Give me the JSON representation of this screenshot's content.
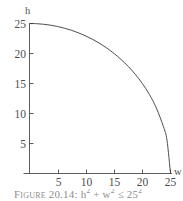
{
  "figure": {
    "caption_label": "Figure 20.14:",
    "caption_formula": "h2 + w2 ≤ 252",
    "caption_full": "Figure 20.14: h² + w² ≤ 25²"
  },
  "axes": {
    "y_axis_name": "h",
    "x_axis_name": "w"
  },
  "chart_data": {
    "type": "line",
    "title": "",
    "subtitle": "",
    "xlabel": "w",
    "ylabel": "h",
    "xlim": [
      0,
      26.5
    ],
    "ylim": [
      0,
      26.5
    ],
    "xticks": [
      5,
      10,
      15,
      20,
      25
    ],
    "yticks": [
      5,
      10,
      15,
      20,
      25
    ],
    "xtick_labels": [
      "5",
      "10",
      "15",
      "20",
      "25"
    ],
    "ytick_labels": [
      "5",
      "10",
      "15",
      "20",
      "25"
    ],
    "grid": false,
    "legend": false,
    "legend_position": "none",
    "annotations": [],
    "curve_equation": "w^2 + h^2 = 25^2",
    "curve_description": "quarter circle of radius 25 in the first quadrant",
    "series": [
      {
        "name": "w^2 + h^2 = 625",
        "color": "#3a3a3a",
        "x": [
          0,
          1.25,
          2.5,
          3.75,
          5,
          6.25,
          7.5,
          8.75,
          10,
          11.25,
          12.5,
          13.75,
          15,
          16.25,
          17.5,
          18.75,
          20,
          21.25,
          22.5,
          23.75,
          24.375,
          25
        ],
        "y": [
          25,
          24.97,
          24.87,
          24.72,
          24.49,
          24.21,
          23.85,
          23.42,
          22.91,
          22.33,
          21.65,
          20.88,
          20,
          18.99,
          17.85,
          16.54,
          15,
          13.18,
          10.9,
          7.8,
          5.57,
          0
        ]
      }
    ]
  }
}
